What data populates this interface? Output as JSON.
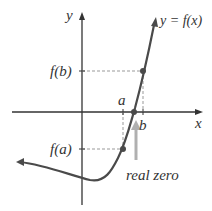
{
  "labels": {
    "y_axis": "y",
    "x_axis": "x",
    "curve": "y = f(x)",
    "fb": "f(b)",
    "fa": "f(a)",
    "a": "a",
    "b": "b",
    "zero": "real zero"
  },
  "colors": {
    "curve": "#4a4a4a",
    "axis": "#333333",
    "dashed": "#999999",
    "zero_arrow": "#b0b0b0"
  }
}
